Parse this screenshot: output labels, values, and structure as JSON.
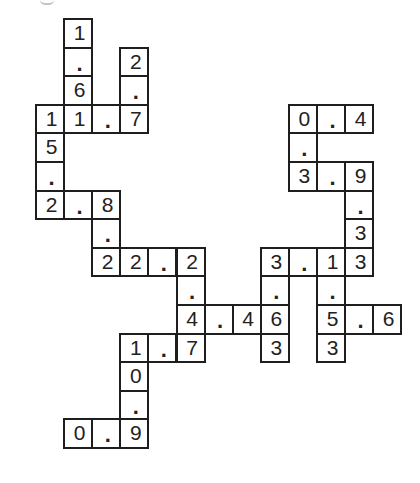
{
  "puzzle": {
    "type": "decimal number crossword",
    "cell_size_px": 28.1,
    "row_size_px": 28.6,
    "origin": {
      "x": 35,
      "y": 18
    },
    "border_color": "#1e1e1e",
    "text_color": "#222222",
    "cells": [
      {
        "col": 1,
        "row": 0,
        "value": "1"
      },
      {
        "col": 1,
        "row": 1,
        "value": "."
      },
      {
        "col": 1,
        "row": 2,
        "value": "6"
      },
      {
        "col": 3,
        "row": 1,
        "value": "2"
      },
      {
        "col": 3,
        "row": 2,
        "value": "."
      },
      {
        "col": 0,
        "row": 3,
        "value": "1"
      },
      {
        "col": 1,
        "row": 3,
        "value": "1"
      },
      {
        "col": 2,
        "row": 3,
        "value": "."
      },
      {
        "col": 3,
        "row": 3,
        "value": "7"
      },
      {
        "col": 0,
        "row": 4,
        "value": "5"
      },
      {
        "col": 0,
        "row": 5,
        "value": "."
      },
      {
        "col": 0,
        "row": 6,
        "value": "2"
      },
      {
        "col": 1,
        "row": 6,
        "value": "."
      },
      {
        "col": 2,
        "row": 6,
        "value": "8"
      },
      {
        "col": 2,
        "row": 7,
        "value": "."
      },
      {
        "col": 2,
        "row": 8,
        "value": "2"
      },
      {
        "col": 3,
        "row": 8,
        "value": "2"
      },
      {
        "col": 4,
        "row": 8,
        "value": "."
      },
      {
        "col": 5,
        "row": 8,
        "value": "2"
      },
      {
        "col": 5,
        "row": 9,
        "value": "."
      },
      {
        "col": 5,
        "row": 10,
        "value": "4"
      },
      {
        "col": 6,
        "row": 10,
        "value": "."
      },
      {
        "col": 7,
        "row": 10,
        "value": "4"
      },
      {
        "col": 8,
        "row": 10,
        "value": "6"
      },
      {
        "col": 3,
        "row": 11,
        "value": "1"
      },
      {
        "col": 4,
        "row": 11,
        "value": "."
      },
      {
        "col": 5,
        "row": 11,
        "value": "7"
      },
      {
        "col": 3,
        "row": 12,
        "value": "0"
      },
      {
        "col": 3,
        "row": 13,
        "value": "."
      },
      {
        "col": 1,
        "row": 14,
        "value": "0"
      },
      {
        "col": 2,
        "row": 14,
        "value": "."
      },
      {
        "col": 3,
        "row": 14,
        "value": "9"
      },
      {
        "col": 9,
        "row": 3,
        "value": "0"
      },
      {
        "col": 10,
        "row": 3,
        "value": "."
      },
      {
        "col": 11,
        "row": 3,
        "value": "4"
      },
      {
        "col": 9,
        "row": 4,
        "value": "."
      },
      {
        "col": 9,
        "row": 5,
        "value": "3"
      },
      {
        "col": 10,
        "row": 5,
        "value": "."
      },
      {
        "col": 11,
        "row": 5,
        "value": "9"
      },
      {
        "col": 11,
        "row": 6,
        "value": "."
      },
      {
        "col": 11,
        "row": 7,
        "value": "3"
      },
      {
        "col": 8,
        "row": 8,
        "value": "3"
      },
      {
        "col": 9,
        "row": 8,
        "value": "."
      },
      {
        "col": 10,
        "row": 8,
        "value": "1"
      },
      {
        "col": 11,
        "row": 8,
        "value": "3"
      },
      {
        "col": 8,
        "row": 9,
        "value": "."
      },
      {
        "col": 10,
        "row": 9,
        "value": "."
      },
      {
        "col": 10,
        "row": 10,
        "value": "5"
      },
      {
        "col": 11,
        "row": 10,
        "value": "."
      },
      {
        "col": 12,
        "row": 10,
        "value": "6"
      },
      {
        "col": 8,
        "row": 11,
        "value": "3"
      },
      {
        "col": 10,
        "row": 11,
        "value": "3"
      }
    ],
    "entries": {
      "across": [
        "11.7",
        "2.8",
        "22.2",
        "4.46",
        "1.7",
        "0.9",
        "0.4",
        "3.9",
        "3.13",
        "5.6"
      ],
      "down": [
        "1.6",
        "2.7",
        "15.2",
        "8.2",
        "2.4",
        "10.9",
        "0.3",
        "9.33",
        "3.63",
        "1.53"
      ]
    }
  }
}
